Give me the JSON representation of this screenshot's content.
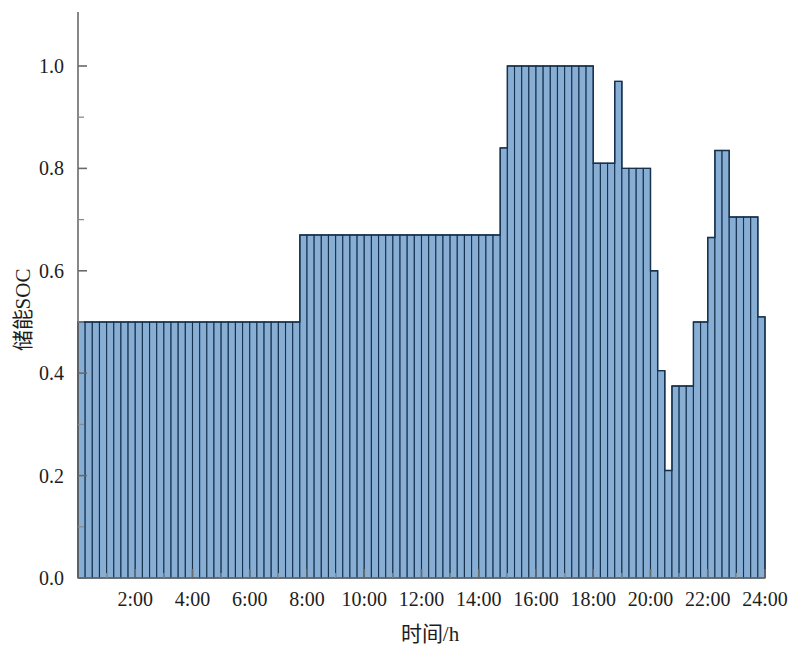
{
  "chart_data": {
    "type": "bar",
    "title": "",
    "subtitle": "",
    "xlabel": "时间/h",
    "ylabel": "储能SOC",
    "xlim": [
      0,
      24
    ],
    "ylim": [
      0.0,
      1.0
    ],
    "grid": false,
    "legend": null,
    "xtick_labels": [
      "2:00",
      "4:00",
      "6:00",
      "8:00",
      "10:00",
      "12:00",
      "14:00",
      "16:00",
      "18:00",
      "20:00",
      "22:00",
      "24:00"
    ],
    "xtick_values": [
      2,
      4,
      6,
      8,
      10,
      12,
      14,
      16,
      18,
      20,
      22,
      24
    ],
    "xtick_minor_values": [
      1,
      3,
      5,
      7,
      9,
      11,
      13,
      15,
      17,
      19,
      21,
      23
    ],
    "ytick_labels": [
      "0.0",
      "0.2",
      "0.4",
      "0.6",
      "0.8",
      "1.0"
    ],
    "ytick_values": [
      0.0,
      0.2,
      0.4,
      0.6,
      0.8,
      1.0
    ],
    "ytick_minor_values": [
      0.1,
      0.3,
      0.5,
      0.7,
      0.9
    ],
    "bar_interval_hours": 0.25,
    "bar_fill_color": "#88aed4",
    "bar_edge_color": "#16324f",
    "x": [
      0.25,
      0.5,
      0.75,
      1.0,
      1.25,
      1.5,
      1.75,
      2.0,
      2.25,
      2.5,
      2.75,
      3.0,
      3.25,
      3.5,
      3.75,
      4.0,
      4.25,
      4.5,
      4.75,
      5.0,
      5.25,
      5.5,
      5.75,
      6.0,
      6.25,
      6.5,
      6.75,
      7.0,
      7.25,
      7.5,
      7.75,
      8.0,
      8.25,
      8.5,
      8.75,
      9.0,
      9.25,
      9.5,
      9.75,
      10.0,
      10.25,
      10.5,
      10.75,
      11.0,
      11.25,
      11.5,
      11.75,
      12.0,
      12.25,
      12.5,
      12.75,
      13.0,
      13.25,
      13.5,
      13.75,
      14.0,
      14.25,
      14.5,
      14.75,
      15.0,
      15.25,
      15.5,
      15.75,
      16.0,
      16.25,
      16.5,
      16.75,
      17.0,
      17.25,
      17.5,
      17.75,
      18.0,
      18.25,
      18.5,
      18.75,
      19.0,
      19.25,
      19.5,
      19.75,
      20.0,
      20.25,
      20.5,
      20.75,
      21.0,
      21.25,
      21.5,
      21.75,
      22.0,
      22.25,
      22.5,
      22.75,
      23.0,
      23.25,
      23.5,
      23.75,
      24.0
    ],
    "values": [
      0.5,
      0.5,
      0.5,
      0.5,
      0.5,
      0.5,
      0.5,
      0.5,
      0.5,
      0.5,
      0.5,
      0.5,
      0.5,
      0.5,
      0.5,
      0.5,
      0.5,
      0.5,
      0.5,
      0.5,
      0.5,
      0.5,
      0.5,
      0.5,
      0.5,
      0.5,
      0.5,
      0.5,
      0.5,
      0.5,
      0.5,
      0.67,
      0.67,
      0.67,
      0.67,
      0.67,
      0.67,
      0.67,
      0.67,
      0.67,
      0.67,
      0.67,
      0.67,
      0.67,
      0.67,
      0.67,
      0.67,
      0.67,
      0.67,
      0.67,
      0.67,
      0.67,
      0.67,
      0.67,
      0.67,
      0.67,
      0.67,
      0.67,
      0.67,
      0.84,
      1.0,
      1.0,
      1.0,
      1.0,
      1.0,
      1.0,
      1.0,
      1.0,
      1.0,
      1.0,
      1.0,
      1.0,
      0.81,
      0.81,
      0.81,
      0.97,
      0.8,
      0.8,
      0.8,
      0.8,
      0.6,
      0.405,
      0.21,
      0.375,
      0.375,
      0.375,
      0.5,
      0.5,
      0.665,
      0.835,
      0.835,
      0.705,
      0.705,
      0.705,
      0.705,
      0.51
    ],
    "series_name": "储能SOC"
  },
  "geometry": {
    "plot_left": 78,
    "plot_right": 765,
    "plot_top": 12,
    "plot_bottom": 578,
    "y_zero_px": 578,
    "y_one_px": 66
  }
}
